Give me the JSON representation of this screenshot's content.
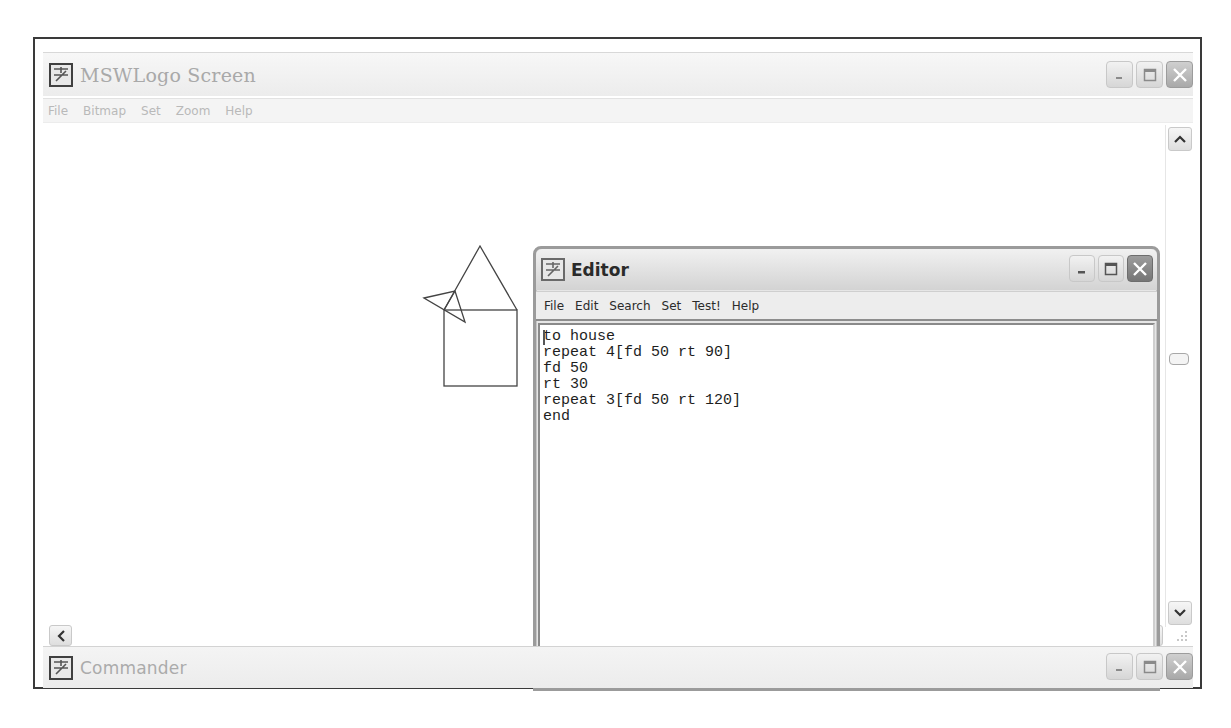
{
  "main_window": {
    "title": "MSWLogo Screen",
    "icon": "mswlogo-app-icon",
    "menu": [
      "File",
      "Bitmap",
      "Set",
      "Zoom",
      "Help"
    ],
    "controls": [
      "minimize",
      "maximize",
      "close"
    ]
  },
  "canvas": {
    "drawing": "house",
    "stroke_color": "#444444",
    "square": {
      "x": 434,
      "y": 247,
      "size": 73
    },
    "roof_apex": {
      "x": 470,
      "y": 183
    },
    "turtle_points": [
      [
        414,
        235
      ],
      [
        445,
        228
      ],
      [
        455,
        259
      ]
    ]
  },
  "editor": {
    "title": "Editor",
    "menu": [
      "File",
      "Edit",
      "Search",
      "Set",
      "Test!",
      "Help"
    ],
    "code_lines": [
      "to house",
      "repeat 4[fd 50 rt 90]",
      "fd 50",
      "rt 30",
      "repeat 3[fd 50 rt 120]",
      "end"
    ]
  },
  "commander": {
    "title": "Commander"
  },
  "scrollbars": {
    "vertical": {
      "up": "scroll-up",
      "down": "scroll-down"
    },
    "horizontal": {
      "left": "scroll-left",
      "right": "scroll-right"
    }
  }
}
